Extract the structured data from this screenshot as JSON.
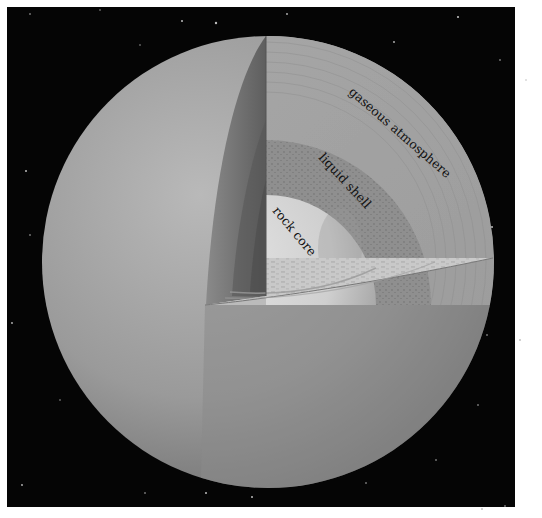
{
  "diagram": {
    "layers": [
      {
        "id": "gaseous-atmosphere",
        "label": "gaseous atmosphere"
      },
      {
        "id": "liquid-shell",
        "label": "liquid shell"
      },
      {
        "id": "rock-core",
        "label": "rock core"
      }
    ],
    "colors": {
      "background": "#050505",
      "frame": "#ffffff",
      "planet_surface": "#9a9a9a",
      "atmosphere_section": "#a8a8a8",
      "liquid_shell": "#8e8e8e",
      "rock_core": "#d6d6d6",
      "label_text": "#111111"
    }
  }
}
